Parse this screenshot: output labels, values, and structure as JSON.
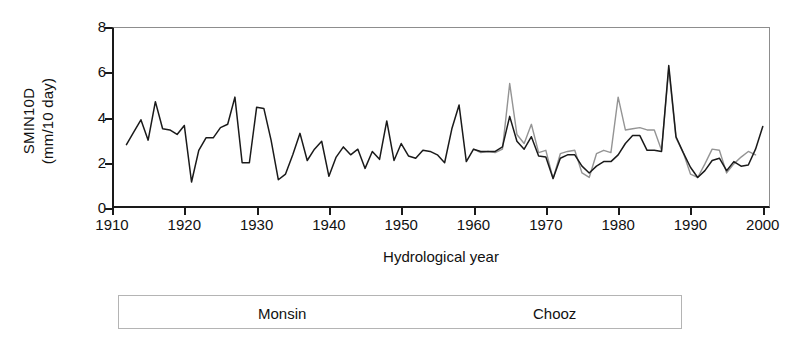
{
  "chart_data": {
    "type": "line",
    "title": "",
    "xlabel": "Hydrological year",
    "ylabel": "SMIN10D (mm/10 day)",
    "ylabel_lines": [
      "SMIN10D",
      "(mm/10 day)"
    ],
    "xlim": [
      1910,
      2001
    ],
    "ylim": [
      0,
      8
    ],
    "xticks": [
      1910,
      1920,
      1930,
      1940,
      1950,
      1960,
      1970,
      1980,
      1990,
      2000
    ],
    "xtick_labels": [
      "1910",
      "1920",
      "1930",
      "1940",
      "1950",
      "1960",
      "1970",
      "1980",
      "1990",
      "2000"
    ],
    "yticks": [
      0,
      2,
      4,
      6,
      8
    ],
    "ytick_labels": [
      "0",
      "2",
      "4",
      "6",
      "8"
    ],
    "grid": false,
    "legend_position": "below",
    "colors": {
      "monsin": "#1a1a1a",
      "chooz": "#949494",
      "axis": "#1a1a1a",
      "frame": "#8d8d8d",
      "legend_border": "#b4b4b4",
      "background": "#ffffff"
    },
    "series": [
      {
        "name": "Monsin",
        "color": "#1a1a1a",
        "x": [
          1912,
          1913,
          1914,
          1915,
          1916,
          1917,
          1918,
          1919,
          1920,
          1921,
          1922,
          1923,
          1924,
          1925,
          1926,
          1927,
          1928,
          1929,
          1930,
          1931,
          1932,
          1933,
          1934,
          1935,
          1936,
          1937,
          1938,
          1939,
          1940,
          1941,
          1942,
          1943,
          1944,
          1945,
          1946,
          1947,
          1948,
          1949,
          1950,
          1951,
          1952,
          1953,
          1954,
          1955,
          1956,
          1957,
          1958,
          1959,
          1960,
          1961,
          1962,
          1963,
          1964,
          1965,
          1966,
          1967,
          1968,
          1969,
          1970,
          1971,
          1972,
          1973,
          1974,
          1975,
          1976,
          1977,
          1978,
          1979,
          1980,
          1981,
          1982,
          1983,
          1984,
          1985,
          1986,
          1987,
          1988,
          1989,
          1990,
          1991,
          1992,
          1993,
          1994,
          1995,
          1996,
          1997,
          1998,
          1999,
          2000
        ],
        "values": [
          2.8,
          3.35,
          3.9,
          3.0,
          4.7,
          3.5,
          3.45,
          3.25,
          3.65,
          1.15,
          2.55,
          3.1,
          3.1,
          3.55,
          3.7,
          4.9,
          2.0,
          2.0,
          4.45,
          4.4,
          3.0,
          1.25,
          1.5,
          2.35,
          3.3,
          2.1,
          2.6,
          2.95,
          1.4,
          2.25,
          2.7,
          2.35,
          2.6,
          1.75,
          2.5,
          2.15,
          3.85,
          2.1,
          2.85,
          2.3,
          2.2,
          2.55,
          2.5,
          2.35,
          2.0,
          3.5,
          4.55,
          2.05,
          2.6,
          2.5,
          2.5,
          2.5,
          2.7,
          4.05,
          2.95,
          2.6,
          3.15,
          2.3,
          2.25,
          1.3,
          2.2,
          2.35,
          2.35,
          1.85,
          1.55,
          1.85,
          2.05,
          2.05,
          2.35,
          2.85,
          3.2,
          3.2,
          2.55,
          2.55,
          2.5,
          6.3,
          3.15,
          2.45,
          1.8,
          1.35,
          1.65,
          2.1,
          2.2,
          1.65,
          2.05,
          1.85,
          1.9,
          2.6,
          3.6
        ]
      },
      {
        "name": "Chooz",
        "color": "#949494",
        "x": [
          1960,
          1961,
          1962,
          1963,
          1964,
          1965,
          1966,
          1967,
          1968,
          1969,
          1970,
          1971,
          1972,
          1973,
          1974,
          1975,
          1976,
          1977,
          1978,
          1979,
          1980,
          1981,
          1982,
          1983,
          1984,
          1985,
          1986,
          1987,
          1988,
          1989,
          1990,
          1991,
          1992,
          1993,
          1994,
          1995,
          1996,
          1997,
          1998,
          1999
        ],
        "values": [
          2.6,
          2.45,
          2.5,
          2.45,
          2.6,
          5.5,
          3.25,
          2.85,
          3.7,
          2.45,
          2.55,
          1.3,
          2.4,
          2.5,
          2.55,
          1.55,
          1.35,
          2.4,
          2.55,
          2.45,
          4.9,
          3.45,
          3.5,
          3.55,
          3.45,
          3.45,
          2.55,
          6.15,
          3.1,
          2.45,
          1.5,
          1.35,
          1.95,
          2.6,
          2.55,
          1.55,
          1.95,
          2.25,
          2.5,
          2.35
        ]
      }
    ]
  }
}
